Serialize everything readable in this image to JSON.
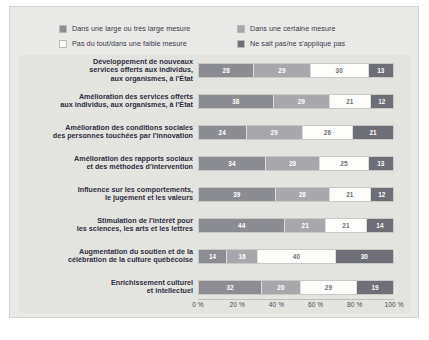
{
  "chart_data": {
    "type": "bar",
    "orientation": "horizontal",
    "stacked": true,
    "stack_mode": "percent",
    "title": "",
    "subtitle": "",
    "xlabel": "",
    "ylabel": "",
    "xlim": [
      0,
      100
    ],
    "grid": false,
    "legend_position": "top",
    "xticks": [
      "0 %",
      "20 %",
      "40 %",
      "60 %",
      "80 %",
      "100 %"
    ],
    "xtick_values": [
      0,
      20,
      40,
      60,
      80,
      100
    ],
    "categories": [
      "Développement de nouveaux services offerts aux individus, aux organismes, à l'État",
      "Amélioration des services offerts aux individus, aux organismes, à l'État",
      "Amélioration des conditions sociales des personnes touchées par l'innovation",
      "Amélioration des rapports sociaux et des méthodes d'intervention",
      "Influence sur les comportements, le jugement et les valeurs",
      "Stimulation de l'intérêt pour les sciences, les arts et les lettres",
      "Augmentation du soutien et de la célébration de la culture québécoise",
      "Enrichissement culturel et intellectuel"
    ],
    "category_lines": [
      [
        "Développement de nouveaux",
        "services offerts aux individus,",
        "aux organismes, à l'État"
      ],
      [
        "Amélioration des services offerts",
        "aux individus, aux organismes, à l'État"
      ],
      [
        "Amélioration des conditions sociales",
        "des personnes touchées par l'innovation"
      ],
      [
        "Amélioration des rapports sociaux",
        "et des méthodes d'intervention"
      ],
      [
        "Influence sur les comportements,",
        "le jugement et les valeurs"
      ],
      [
        "Stimulation de l'intérêt pour",
        "les sciences, les arts et les lettres"
      ],
      [
        "Augmentation du soutien et de la",
        "célébration de la culture québécoise"
      ],
      [
        "Enrichissement culturel",
        "et intellectuel"
      ]
    ],
    "series": [
      {
        "name": "Dans une large ou très large mesure",
        "color": "#8c8c93",
        "values": [
          28,
          38,
          24,
          34,
          39,
          44,
          14,
          32
        ]
      },
      {
        "name": "Dans une certaine mesure",
        "color": "#a7a7ac",
        "values": [
          29,
          29,
          29,
          28,
          28,
          21,
          16,
          20
        ]
      },
      {
        "name": "Pas du tout/dans une faible mesure",
        "color": "#fdfdfb",
        "values": [
          30,
          21,
          26,
          25,
          21,
          21,
          40,
          29
        ]
      },
      {
        "name": "Ne sait pas/ne s'applique pas",
        "color": "#6e6e77",
        "values": [
          13,
          12,
          21,
          13,
          12,
          14,
          30,
          19
        ]
      }
    ]
  },
  "legend": {
    "items": [
      {
        "label": "Dans une large ou très large mesure",
        "color": "#8c8c93"
      },
      {
        "label": "Dans une certaine mesure",
        "color": "#a7a7ac"
      },
      {
        "label": "Pas du tout/dans une faible mesure",
        "color": "#fdfdfb"
      },
      {
        "label": "Ne sait pas/ne s'applique pas",
        "color": "#6e6e77"
      }
    ]
  }
}
